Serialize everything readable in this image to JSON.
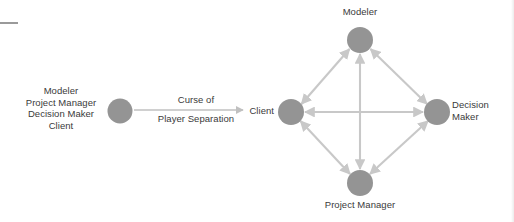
{
  "figure": {
    "background_color": "#ffffff",
    "node_color": "#949494",
    "edge_color": "#c8c8c8",
    "text_color": "#3a3a3a",
    "artifact_color": "#9a9a9a"
  },
  "left_group": {
    "roles": [
      "Modeler",
      "Project Manager",
      "Decision Maker",
      "Client"
    ],
    "node_label": "",
    "arrow_label_line1": "Curse of",
    "arrow_label_line2": "Player Separation"
  },
  "diamond": {
    "nodes": [
      {
        "id": "modeler",
        "label": "Modeler",
        "cx": 360,
        "cy": 40,
        "r": 13
      },
      {
        "id": "client",
        "label": "Client",
        "cx": 291,
        "cy": 112,
        "r": 13
      },
      {
        "id": "decision_maker",
        "label_line1": "Decision",
        "label_line2": "Maker",
        "cx": 437,
        "cy": 112,
        "r": 13
      },
      {
        "id": "project_manager",
        "label": "Project Manager",
        "cx": 360,
        "cy": 183,
        "r": 13
      }
    ],
    "edges": [
      {
        "from": "client",
        "to": "modeler",
        "arrowheads": "both"
      },
      {
        "from": "modeler",
        "to": "decision_maker",
        "arrowheads": "both"
      },
      {
        "from": "client",
        "to": "project_manager",
        "arrowheads": "both"
      },
      {
        "from": "project_manager",
        "to": "decision_maker",
        "arrowheads": "both"
      },
      {
        "from": "client",
        "to": "decision_maker",
        "arrowheads": "both"
      },
      {
        "from": "modeler",
        "to": "project_manager",
        "arrowheads": "both"
      }
    ]
  },
  "separation_arrow": {
    "from_x": 134,
    "to_x": 244,
    "y": 110,
    "arrowheads": "end"
  }
}
